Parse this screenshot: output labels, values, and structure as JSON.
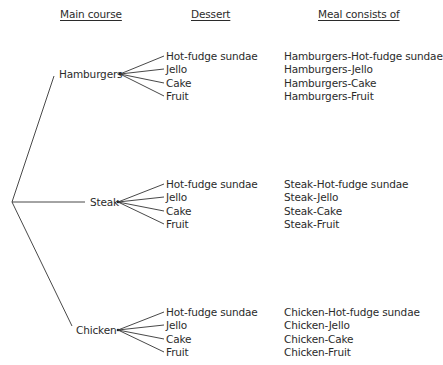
{
  "headers": {
    "main_course": "Main course",
    "dessert": "Dessert",
    "meal": "Meal consists of"
  },
  "tree": {
    "root": {
      "x": 12,
      "y": 202
    },
    "main_courses": [
      {
        "label": "Hamburgers",
        "line_end": {
          "x": 54,
          "y": 76
        },
        "label_pos": {
          "x": 59,
          "y": 68
        },
        "node": {
          "x": 120,
          "y": 74
        },
        "desserts": [
          "Hot-fudge sundae",
          "Jello",
          "Cake",
          "Fruit"
        ],
        "dessert_y": [
          50,
          63,
          77,
          90
        ],
        "meals": [
          "Hamburgers-Hot-fudge sundae",
          "Hamburgers-Jello",
          "Hamburgers-Cake",
          "Hamburgers-Fruit"
        ]
      },
      {
        "label": "Steak",
        "line_end": {
          "x": 85,
          "y": 202
        },
        "label_pos": {
          "x": 90,
          "y": 196
        },
        "node": {
          "x": 118,
          "y": 202
        },
        "desserts": [
          "Hot-fudge sundae",
          "Jello",
          "Cake",
          "Fruit"
        ],
        "dessert_y": [
          178,
          191,
          205,
          218
        ],
        "meals": [
          "Steak-Hot-fudge sundae",
          "Steak-Jello",
          "Steak-Cake",
          "Steak-Fruit"
        ]
      },
      {
        "label": "Chicken",
        "line_end": {
          "x": 72,
          "y": 326
        },
        "label_pos": {
          "x": 76,
          "y": 324
        },
        "node": {
          "x": 118,
          "y": 330
        },
        "desserts": [
          "Hot-fudge sundae",
          "Jello",
          "Cake",
          "Fruit"
        ],
        "dessert_y": [
          306,
          319,
          333,
          346
        ],
        "meals": [
          "Chicken-Hot-fudge sundae",
          "Chicken-Jello",
          "Chicken-Cake",
          "Chicken-Fruit"
        ]
      }
    ],
    "dessert_x": 166,
    "dessert_line_end_x": 164,
    "meal_x": 284
  }
}
